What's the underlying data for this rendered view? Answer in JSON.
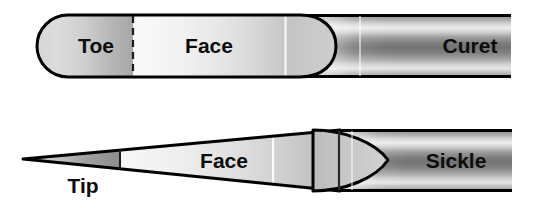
{
  "figure": {
    "background_color": "#ffffff",
    "outline_color": "#000000",
    "label_color": "#0d0d0d",
    "instruments": [
      {
        "name": "curet",
        "shank_label": "Curet",
        "blade_parts": [
          {
            "label": "Toe",
            "note": "rounded blade end"
          },
          {
            "label": "Face",
            "note": "flat working surface"
          }
        ],
        "divider_style": "dashed",
        "blade_end_shape": "rounded",
        "shank_shading": "banded-metallic"
      },
      {
        "name": "sickle",
        "shank_label": "Sickle",
        "blade_parts": [
          {
            "label": "Tip",
            "note": "pointed blade end"
          },
          {
            "label": "Face",
            "note": "flat working surface"
          }
        ],
        "divider_style": "solid",
        "blade_end_shape": "pointed",
        "shank_shading": "banded-metallic"
      }
    ]
  },
  "labels": {
    "toe": "Toe",
    "face_top": "Face",
    "curet": "Curet",
    "tip": "Tip",
    "face_bottom": "Face",
    "sickle": "Sickle"
  }
}
